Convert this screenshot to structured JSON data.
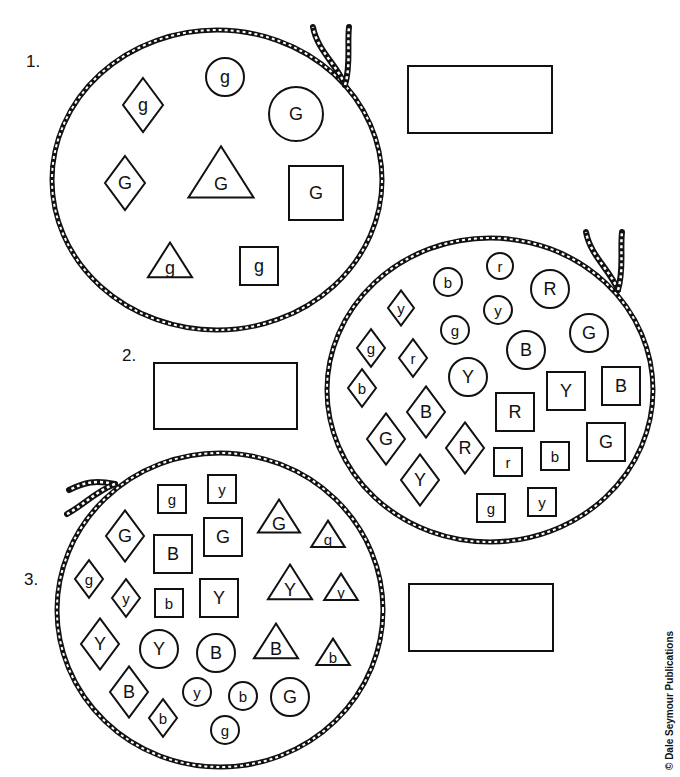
{
  "worksheet": {
    "problems": [
      {
        "number": "1.",
        "label_pos": [
          26,
          58
        ],
        "answer_box": {
          "x": 407,
          "y": 65,
          "w": 146,
          "h": 69,
          "value": ""
        },
        "loop": {
          "cx": 217,
          "cy": 180,
          "rx": 165,
          "ry": 150,
          "tie": [
            345,
            85
          ]
        },
        "shapes": [
          {
            "type": "diamond",
            "letter": "g",
            "x": 143,
            "y": 105,
            "s": 20
          },
          {
            "type": "circle",
            "letter": "g",
            "x": 225,
            "y": 77,
            "s": 19
          },
          {
            "type": "circle",
            "letter": "G",
            "x": 296,
            "y": 114,
            "s": 27
          },
          {
            "type": "diamond",
            "letter": "G",
            "x": 125,
            "y": 183,
            "s": 20
          },
          {
            "type": "triangle",
            "letter": "G",
            "x": 221,
            "y": 178,
            "s": 31
          },
          {
            "type": "square",
            "letter": "G",
            "x": 316,
            "y": 193,
            "s": 27
          },
          {
            "type": "triangle",
            "letter": "g",
            "x": 170,
            "y": 264,
            "s": 21
          },
          {
            "type": "square",
            "letter": "g",
            "x": 259,
            "y": 266,
            "s": 19
          }
        ]
      },
      {
        "number": "2.",
        "label_pos": [
          122,
          350
        ],
        "answer_box": {
          "x": 153,
          "y": 362,
          "w": 145,
          "h": 68,
          "value": ""
        },
        "loop": {
          "cx": 490,
          "cy": 390,
          "rx": 163,
          "ry": 152,
          "tie": [
            618,
            290
          ]
        },
        "shapes": [
          {
            "type": "circle",
            "letter": "b",
            "x": 448,
            "y": 282,
            "s": 14
          },
          {
            "type": "circle",
            "letter": "r",
            "x": 500,
            "y": 266,
            "s": 13
          },
          {
            "type": "circle",
            "letter": "R",
            "x": 550,
            "y": 289,
            "s": 19
          },
          {
            "type": "diamond",
            "letter": "y",
            "x": 401,
            "y": 308,
            "s": 13
          },
          {
            "type": "circle",
            "letter": "y",
            "x": 498,
            "y": 310,
            "s": 14
          },
          {
            "type": "circle",
            "letter": "g",
            "x": 455,
            "y": 330,
            "s": 14
          },
          {
            "type": "circle",
            "letter": "G",
            "x": 589,
            "y": 333,
            "s": 19
          },
          {
            "type": "diamond",
            "letter": "g",
            "x": 371,
            "y": 348,
            "s": 14
          },
          {
            "type": "diamond",
            "letter": "r",
            "x": 413,
            "y": 358,
            "s": 14
          },
          {
            "type": "circle",
            "letter": "B",
            "x": 526,
            "y": 350,
            "s": 19
          },
          {
            "type": "circle",
            "letter": "Y",
            "x": 468,
            "y": 377,
            "s": 19
          },
          {
            "type": "diamond",
            "letter": "b",
            "x": 362,
            "y": 388,
            "s": 14
          },
          {
            "type": "square",
            "letter": "Y",
            "x": 566,
            "y": 391,
            "s": 19
          },
          {
            "type": "square",
            "letter": "B",
            "x": 621,
            "y": 386,
            "s": 19
          },
          {
            "type": "diamond",
            "letter": "B",
            "x": 426,
            "y": 412,
            "s": 19
          },
          {
            "type": "square",
            "letter": "R",
            "x": 515,
            "y": 412,
            "s": 19
          },
          {
            "type": "diamond",
            "letter": "G",
            "x": 386,
            "y": 439,
            "s": 19
          },
          {
            "type": "diamond",
            "letter": "R",
            "x": 465,
            "y": 448,
            "s": 19
          },
          {
            "type": "square",
            "letter": "G",
            "x": 606,
            "y": 442,
            "s": 19
          },
          {
            "type": "square",
            "letter": "r",
            "x": 508,
            "y": 462,
            "s": 14
          },
          {
            "type": "square",
            "letter": "b",
            "x": 555,
            "y": 456,
            "s": 14
          },
          {
            "type": "diamond",
            "letter": "Y",
            "x": 420,
            "y": 480,
            "s": 19
          },
          {
            "type": "square",
            "letter": "g",
            "x": 491,
            "y": 508,
            "s": 14
          },
          {
            "type": "square",
            "letter": "y",
            "x": 542,
            "y": 502,
            "s": 14
          }
        ]
      },
      {
        "number": "3.",
        "label_pos": [
          24,
          576
        ],
        "answer_box": {
          "x": 408,
          "y": 583,
          "w": 146,
          "h": 69,
          "value": ""
        },
        "loop": {
          "cx": 220,
          "cy": 610,
          "rx": 163,
          "ry": 157,
          "tie": [
            115,
            484
          ]
        },
        "shapes": [
          {
            "type": "square",
            "letter": "g",
            "x": 172,
            "y": 499,
            "s": 14
          },
          {
            "type": "square",
            "letter": "y",
            "x": 222,
            "y": 489,
            "s": 14
          },
          {
            "type": "diamond",
            "letter": "G",
            "x": 125,
            "y": 536,
            "s": 19
          },
          {
            "type": "square",
            "letter": "B",
            "x": 173,
            "y": 554,
            "s": 19
          },
          {
            "type": "square",
            "letter": "G",
            "x": 223,
            "y": 537,
            "s": 19
          },
          {
            "type": "triangle",
            "letter": "G",
            "x": 279,
            "y": 520,
            "s": 20
          },
          {
            "type": "triangle",
            "letter": "g",
            "x": 328,
            "y": 537,
            "s": 16
          },
          {
            "type": "diamond",
            "letter": "g",
            "x": 89,
            "y": 579,
            "s": 14
          },
          {
            "type": "diamond",
            "letter": "y",
            "x": 126,
            "y": 598,
            "s": 14
          },
          {
            "type": "square",
            "letter": "b",
            "x": 169,
            "y": 603,
            "s": 14
          },
          {
            "type": "square",
            "letter": "Y",
            "x": 219,
            "y": 598,
            "s": 19
          },
          {
            "type": "triangle",
            "letter": "Y",
            "x": 290,
            "y": 586,
            "s": 21
          },
          {
            "type": "triangle",
            "letter": "y",
            "x": 341,
            "y": 590,
            "s": 16
          },
          {
            "type": "diamond",
            "letter": "Y",
            "x": 100,
            "y": 644,
            "s": 19
          },
          {
            "type": "circle",
            "letter": "Y",
            "x": 159,
            "y": 649,
            "s": 19
          },
          {
            "type": "circle",
            "letter": "B",
            "x": 216,
            "y": 653,
            "s": 19
          },
          {
            "type": "triangle",
            "letter": "B",
            "x": 276,
            "y": 645,
            "s": 21
          },
          {
            "type": "triangle",
            "letter": "b",
            "x": 333,
            "y": 655,
            "s": 16
          },
          {
            "type": "diamond",
            "letter": "B",
            "x": 129,
            "y": 692,
            "s": 19
          },
          {
            "type": "circle",
            "letter": "y",
            "x": 197,
            "y": 692,
            "s": 14
          },
          {
            "type": "circle",
            "letter": "b",
            "x": 243,
            "y": 696,
            "s": 14
          },
          {
            "type": "circle",
            "letter": "G",
            "x": 290,
            "y": 697,
            "s": 19
          },
          {
            "type": "diamond",
            "letter": "b",
            "x": 163,
            "y": 718,
            "s": 14
          },
          {
            "type": "circle",
            "letter": "g",
            "x": 225,
            "y": 730,
            "s": 14
          }
        ]
      }
    ],
    "copyright": "© Dale Seymour Publications"
  }
}
